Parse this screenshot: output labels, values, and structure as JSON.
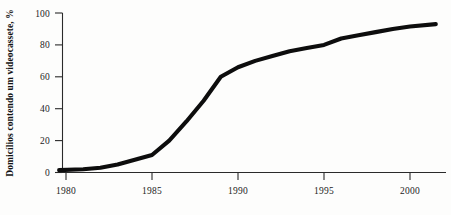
{
  "chart_data": {
    "type": "line",
    "title": "",
    "subtitle": "",
    "xlabel": "",
    "ylabel": "Domicílios contendo um videocassete, %",
    "xlim": [
      1979.3,
      2001.8
    ],
    "ylim": [
      0,
      100
    ],
    "grid": false,
    "legend": null,
    "x_ticks": [
      1980,
      1985,
      1990,
      1995,
      2000
    ],
    "x_tick_labels": [
      "1980",
      "1985",
      "1990",
      "1995",
      "2000"
    ],
    "y_ticks": [
      0,
      20,
      40,
      60,
      80,
      100
    ],
    "y_tick_labels": [
      "0",
      "20",
      "40",
      "60",
      "80",
      "100"
    ],
    "series": [
      {
        "name": "Domicílios contendo um videocassete",
        "color": "#0d0d0d",
        "x": [
          1979.6,
          1981,
          1982,
          1983,
          1984,
          1985,
          1986,
          1987,
          1988,
          1989,
          1990,
          1991,
          1992,
          1993,
          1994,
          1995,
          1996,
          1997,
          1998,
          1999,
          2000,
          2001.5
        ],
        "values": [
          1.5,
          2,
          3,
          5,
          8,
          11,
          20,
          32,
          45,
          60,
          66,
          70,
          73,
          76,
          78,
          80,
          84,
          86,
          88,
          90,
          91.5,
          93
        ]
      }
    ],
    "annotations": []
  },
  "axis": {
    "y_title": "Domicílios contendo um videocassete, %",
    "y_tick_0": "0",
    "y_tick_1": "20",
    "y_tick_2": "40",
    "y_tick_3": "60",
    "y_tick_4": "80",
    "y_tick_5": "100",
    "x_tick_0": "1980",
    "x_tick_1": "1985",
    "x_tick_2": "1990",
    "x_tick_3": "1995",
    "x_tick_4": "2000"
  },
  "colors": {
    "line": "#0d0d0d",
    "axis": "#2a2a2a",
    "background": "#fdfdfc",
    "text": "#1b1b1b"
  }
}
